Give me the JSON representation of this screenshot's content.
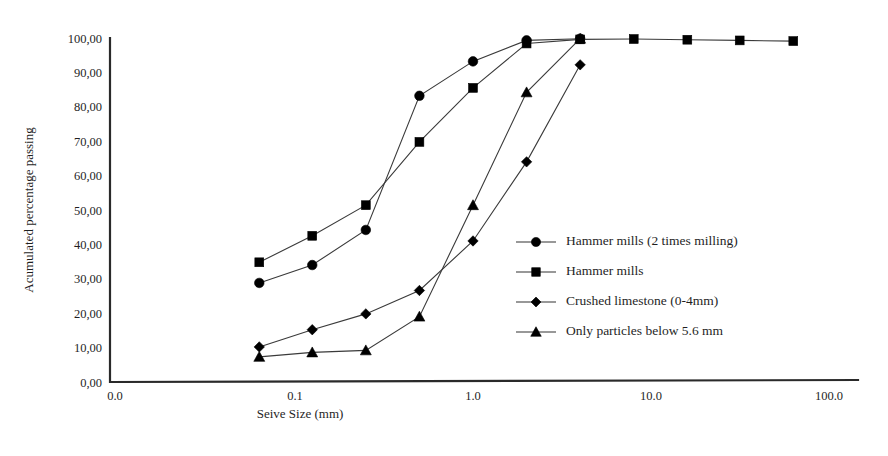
{
  "chart_data": {
    "type": "line",
    "title": "",
    "subtitle": "",
    "xlabel": "Seive Size (mm)",
    "ylabel": "Acumulated  percentage passing",
    "xscale": "log",
    "yscale": "linear",
    "xlim": [
      0.0,
      100.0
    ],
    "ylim": [
      0.0,
      100.0
    ],
    "grid": false,
    "legend_position": "center-right inside plot",
    "xticklabels": [
      "0.0",
      "0.1",
      "1.0",
      "10.0",
      "100.0"
    ],
    "xtickvalues": [
      0.0,
      0.1,
      1.0,
      10.0,
      100.0
    ],
    "yticklabels": [
      "0,00",
      "10,00",
      "20,00",
      "30,00",
      "40,00",
      "50,00",
      "60,00",
      "70,00",
      "80,00",
      "90,00",
      "100,00"
    ],
    "ytickvalues": [
      0,
      10,
      20,
      30,
      40,
      50,
      60,
      70,
      80,
      90,
      100
    ],
    "series": [
      {
        "name": "Hammer mills (2 times milling)",
        "marker": "circle",
        "x": [
          0.063,
          0.125,
          0.25,
          0.5,
          1.0,
          2.0,
          4.0
        ],
        "values": [
          28.8,
          34.0,
          44.2,
          83.2,
          93.2,
          99.3,
          99.8
        ]
      },
      {
        "name": "Hammer mills",
        "marker": "square",
        "x": [
          0.063,
          0.125,
          0.25,
          0.5,
          1.0,
          2.0,
          4.0,
          8.0,
          16.0,
          31.5,
          63.0
        ],
        "values": [
          34.8,
          42.5,
          51.4,
          69.8,
          85.5,
          98.4,
          99.6,
          99.7,
          99.5,
          99.3,
          99.1
        ]
      },
      {
        "name": "Crushed limestone (0-4mm)",
        "marker": "diamond",
        "x": [
          0.063,
          0.125,
          0.25,
          0.5,
          1.0,
          2.0,
          4.0
        ],
        "values": [
          10.2,
          15.2,
          19.8,
          26.6,
          41.0,
          64.0,
          92.2
        ]
      },
      {
        "name": "Only particles below 5.6 mm",
        "marker": "triangle",
        "x": [
          0.063,
          0.125,
          0.25,
          0.5,
          1.0,
          2.0,
          4.0
        ],
        "values": [
          7.3,
          8.6,
          9.2,
          19.0,
          51.4,
          84.2,
          99.8
        ]
      }
    ]
  },
  "axes": {
    "ylabel": "Acumulated  percentage passing",
    "xlabel": "Seive Size (mm)"
  },
  "legend": {
    "items": [
      {
        "label": "Hammer mills (2 times milling)",
        "marker": "circle"
      },
      {
        "label": "Hammer mills",
        "marker": "square"
      },
      {
        "label": "Crushed limestone (0-4mm)",
        "marker": "diamond"
      },
      {
        "label": "Only particles below 5.6 mm",
        "marker": "triangle"
      }
    ]
  },
  "colors": {
    "ink": "#1a1a1a",
    "axis": "#2a2a2a",
    "series": "#3a3a3a",
    "marker": "#000000",
    "background": "#ffffff"
  }
}
